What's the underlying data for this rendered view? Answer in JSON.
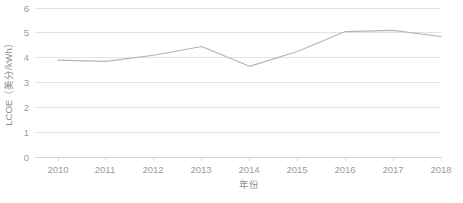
{
  "chart_data": {
    "type": "line",
    "title": "",
    "xlabel": "年份",
    "ylabel": "LCOE（美分/kWh）",
    "categories": [
      2010,
      2011,
      2012,
      2013,
      2014,
      2015,
      2016,
      2017,
      2018
    ],
    "x_tick_labels": [
      "2010",
      "2011",
      "2012",
      "2013",
      "2014",
      "2015",
      "2016",
      "2017",
      "2018"
    ],
    "y_tick_labels": [
      "0",
      "1",
      "2",
      "3",
      "4",
      "5",
      "6"
    ],
    "y_ticks": [
      0,
      1,
      2,
      3,
      4,
      5,
      6
    ],
    "ylim": [
      0,
      6
    ],
    "xlim": [
      2010,
      2018
    ],
    "grid": true,
    "legend": "none",
    "series": [
      {
        "name": "LCOE",
        "color": "#b4b4b4",
        "values": [
          3.9,
          3.85,
          4.1,
          4.45,
          3.65,
          4.25,
          5.05,
          5.1,
          4.85
        ]
      }
    ]
  },
  "caption": {
    "text": ""
  }
}
